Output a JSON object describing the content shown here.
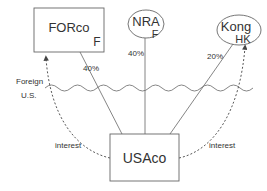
{
  "diagram": {
    "entities": {
      "forco": {
        "name": "FORco",
        "jurisdiction": "F",
        "shape": "rectangle"
      },
      "nra": {
        "name": "NRA",
        "jurisdiction": "F",
        "shape": "ellipse"
      },
      "kong": {
        "name": "Kong",
        "jurisdiction": "HK",
        "shape": "ellipse"
      },
      "usaco": {
        "name": "USAco",
        "shape": "rectangle"
      }
    },
    "ownership": [
      {
        "owner": "FORco",
        "owned": "USAco",
        "percent": "40%"
      },
      {
        "owner": "NRA",
        "owned": "USAco",
        "percent": "40%"
      },
      {
        "owner": "Kong",
        "owned": "USAco",
        "percent": "20%"
      }
    ],
    "payments": [
      {
        "from": "USAco",
        "to": "FORco",
        "label": "interest"
      },
      {
        "from": "USAco",
        "to": "Kong",
        "label": "interest"
      }
    ],
    "border": {
      "above": "Foreign",
      "below": "U.S."
    },
    "colors": {
      "line": "#555555",
      "text": "#333333",
      "background": "#ffffff"
    }
  }
}
